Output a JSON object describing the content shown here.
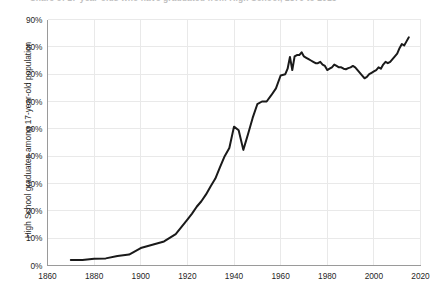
{
  "chart_data": {
    "type": "line",
    "title": "Share of 17-year-olds who have graduated from High School, 1870 to 2015",
    "xlabel": "",
    "ylabel": "High School graduates among 17-year-old population",
    "xlim": [
      1860,
      2020
    ],
    "ylim": [
      0,
      90
    ],
    "grid": true,
    "legend": false,
    "xticks": [
      "1860",
      "1880",
      "1900",
      "1920",
      "1940",
      "1960",
      "1980",
      "2000",
      "2020"
    ],
    "xtick_values": [
      1860,
      1880,
      1900,
      1920,
      1940,
      1960,
      1980,
      2000,
      2020
    ],
    "yticks": [
      "0%",
      "10%",
      "20%",
      "30%",
      "40%",
      "50%",
      "60%",
      "70%",
      "80%",
      "90%"
    ],
    "ytick_values": [
      0,
      10,
      20,
      30,
      40,
      50,
      60,
      70,
      80,
      90
    ],
    "line_color": "#1a1a1a",
    "grid_color": "#e9e9e9",
    "series": [
      {
        "name": "High School graduates among 17-year-old population",
        "x": [
          1870,
          1875,
          1880,
          1885,
          1890,
          1895,
          1900,
          1905,
          1910,
          1915,
          1920,
          1922,
          1924,
          1926,
          1928,
          1930,
          1932,
          1934,
          1936,
          1938,
          1940,
          1942,
          1944,
          1946,
          1948,
          1950,
          1952,
          1954,
          1956,
          1958,
          1960,
          1962,
          1963,
          1964,
          1965,
          1966,
          1967,
          1968,
          1969,
          1970,
          1971,
          1972,
          1973,
          1974,
          1975,
          1976,
          1977,
          1978,
          1979,
          1980,
          1981,
          1982,
          1983,
          1984,
          1985,
          1986,
          1987,
          1988,
          1989,
          1990,
          1991,
          1992,
          1993,
          1994,
          1995,
          1996,
          1997,
          1998,
          1999,
          2000,
          2001,
          2002,
          2003,
          2004,
          2005,
          2006,
          2007,
          2008,
          2009,
          2010,
          2011,
          2012,
          2013,
          2014,
          2015
        ],
        "y": [
          2.0,
          2.0,
          2.5,
          2.6,
          3.5,
          4.0,
          6.4,
          7.6,
          8.8,
          11.5,
          16.8,
          19.0,
          21.5,
          23.5,
          26.0,
          29.0,
          31.8,
          36.0,
          40.0,
          43.0,
          50.8,
          49.5,
          42.3,
          48.0,
          54.0,
          59.0,
          60.0,
          60.0,
          62.3,
          64.8,
          69.5,
          70.0,
          72.0,
          76.3,
          71.5,
          76.5,
          77.0,
          77.0,
          78.0,
          76.5,
          76.0,
          75.5,
          75.0,
          74.5,
          74.0,
          74.0,
          74.5,
          73.5,
          73.0,
          71.5,
          72.0,
          72.5,
          73.5,
          73.0,
          72.5,
          72.5,
          72.0,
          71.8,
          72.2,
          72.5,
          73.0,
          72.5,
          71.5,
          70.5,
          69.5,
          68.5,
          69.0,
          70.0,
          70.5,
          71.0,
          71.5,
          72.5,
          72.0,
          73.5,
          74.5,
          74.0,
          74.5,
          75.5,
          76.5,
          77.5,
          79.5,
          81.0,
          80.5,
          82.0,
          83.5
        ]
      }
    ]
  }
}
